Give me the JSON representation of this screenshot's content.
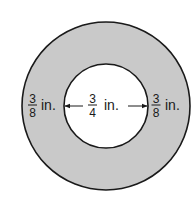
{
  "diagram": {
    "type": "annulus",
    "colors": {
      "ring_fill": "#c9c9c9",
      "hole_fill": "#ffffff",
      "stroke": "#1a1a1a"
    },
    "outer_circle": {
      "cx": 106,
      "cy": 106,
      "r": 84
    },
    "inner_circle": {
      "cx": 106,
      "cy": 106,
      "r": 42
    },
    "labels": {
      "left_width": {
        "numerator": "3",
        "denominator": "8",
        "unit": "in."
      },
      "inner_diameter": {
        "numerator": "3",
        "denominator": "4",
        "unit": "in."
      },
      "right_width": {
        "numerator": "3",
        "denominator": "8",
        "unit": "in."
      }
    }
  }
}
